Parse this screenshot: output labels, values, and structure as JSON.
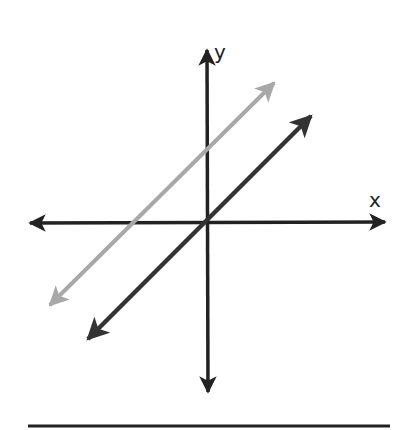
{
  "diagram": {
    "title": "",
    "axes": {
      "x_label": "x",
      "y_label": "y",
      "color": "#222222"
    },
    "lines": [
      {
        "name": "gray-parallel-line",
        "color": "#a8a8a8",
        "from": [
          47,
          308
        ],
        "to": [
          278,
          80
        ]
      },
      {
        "name": "dark-parallel-line",
        "color": "#333333",
        "from": [
          85,
          342
        ],
        "to": [
          315,
          113
        ]
      }
    ],
    "baseline_color": "#222222"
  }
}
